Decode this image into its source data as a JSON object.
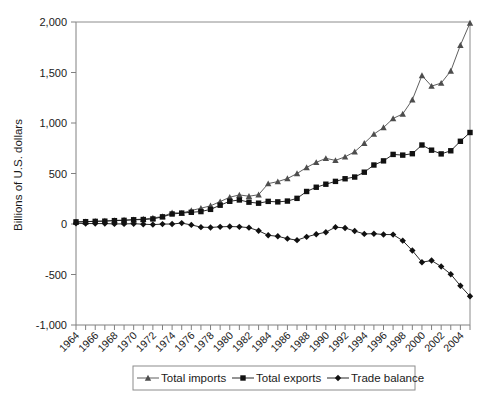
{
  "chart_data": {
    "type": "line",
    "title": "",
    "xlabel": "",
    "ylabel": "Billions of U.S. dollars",
    "ylim": [
      -1000,
      2000
    ],
    "xlim": [
      1964,
      2005
    ],
    "ytick_labels": [
      "2,000",
      "1,500",
      "1,000",
      "500",
      "0",
      "-500",
      "-1,000"
    ],
    "ytick_values": [
      2000,
      1500,
      1000,
      500,
      0,
      -500,
      -1000
    ],
    "xtick_labels": [
      "1964",
      "1966",
      "1968",
      "1970",
      "1972",
      "1974",
      "1976",
      "1978",
      "1980",
      "1982",
      "1984",
      "1986",
      "1988",
      "1990",
      "1992",
      "1994",
      "1996",
      "1998",
      "2000",
      "2002",
      "2004"
    ],
    "minor_xticks_every": 1,
    "grid": false,
    "legend_position": "below-plot",
    "x": [
      1964,
      1965,
      1966,
      1967,
      1968,
      1969,
      1970,
      1971,
      1972,
      1973,
      1974,
      1975,
      1976,
      1977,
      1978,
      1979,
      1980,
      1981,
      1982,
      1983,
      1984,
      1985,
      1986,
      1987,
      1988,
      1989,
      1990,
      1991,
      1992,
      1993,
      1994,
      1995,
      1996,
      1997,
      1998,
      1999,
      2000,
      2001,
      2002,
      2003,
      2004,
      2005
    ],
    "series": [
      {
        "name": "Total imports",
        "marker": "triangle",
        "color": "#4d4d4d",
        "values": [
          20,
          23,
          28,
          30,
          36,
          39,
          43,
          49,
          59,
          74,
          112,
          108,
          134,
          156,
          180,
          222,
          265,
          288,
          275,
          290,
          400,
          420,
          450,
          500,
          560,
          610,
          650,
          630,
          665,
          715,
          800,
          890,
          955,
          1045,
          1090,
          1230,
          1470,
          1365,
          1395,
          1515,
          1770,
          1990
        ]
      },
      {
        "name": "Total exports",
        "marker": "square",
        "color": "#111111",
        "values": [
          21,
          23,
          26,
          28,
          33,
          36,
          42,
          44,
          50,
          71,
          99,
          108,
          116,
          123,
          145,
          186,
          225,
          238,
          216,
          206,
          224,
          219,
          227,
          254,
          322,
          364,
          394,
          422,
          448,
          465,
          513,
          584,
          625,
          689,
          682,
          696,
          782,
          731,
          694,
          725,
          819,
          906
        ]
      },
      {
        "name": "Trade balance",
        "marker": "diamond",
        "color": "#111111",
        "values": [
          7,
          5,
          4,
          4,
          1,
          1,
          3,
          -2,
          -6,
          -1,
          0,
          9,
          -9,
          -31,
          -34,
          -28,
          -25,
          -28,
          -36,
          -67,
          -112,
          -122,
          -145,
          -160,
          -127,
          -102,
          -81,
          -31,
          -39,
          -70,
          -98,
          -96,
          -104,
          -105,
          -165,
          -263,
          -378,
          -362,
          -421,
          -497,
          -612,
          -716
        ]
      }
    ]
  },
  "legend": {
    "items": [
      {
        "label": "Total imports",
        "marker": "triangle"
      },
      {
        "label": "Total exports",
        "marker": "square"
      },
      {
        "label": "Trade balance",
        "marker": "diamond"
      }
    ]
  }
}
